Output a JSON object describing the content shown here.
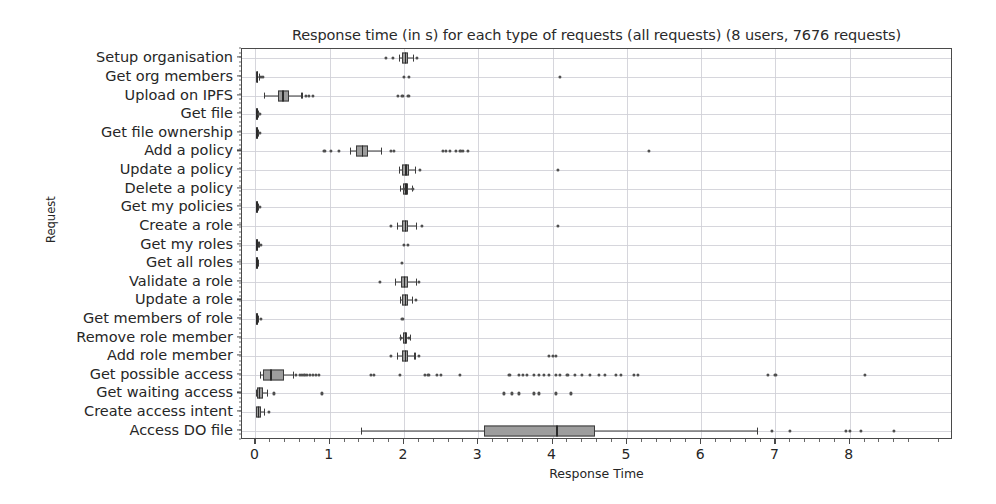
{
  "chart_data": {
    "type": "boxplot",
    "title": "Response time (in s) for each type of requests (all requests) (8 users, 7676 requests)",
    "xlabel": "Response Time",
    "ylabel": "Request",
    "xlim": [
      -0.18,
      9.39
    ],
    "ylim_categories": 21,
    "grid": true,
    "orientation": "horizontal",
    "legend": null,
    "xticks": [
      0,
      1,
      2,
      3,
      4,
      5,
      6,
      7,
      8
    ],
    "xtick_labels": [
      "0",
      "1",
      "2",
      "3",
      "4",
      "5",
      "6",
      "7",
      "8"
    ],
    "xminor_step": 0.2,
    "box_facecolor": "#9d9d9d",
    "box_edgecolor": "#3b3b3b",
    "categories": [
      "Setup organisation",
      "Get org members",
      "Upload on IPFS",
      "Get file",
      "Get file ownership",
      "Add a policy",
      "Update a policy",
      "Delete a policy",
      "Get my policies",
      "Create a role",
      "Get my roles",
      "Get all roles",
      "Validate a role",
      "Update a role",
      "Get members of role",
      "Remove role member",
      "Add role member",
      "Get possible access",
      "Get waiting access",
      "Create access intent",
      "Access DO file"
    ],
    "boxes": [
      {
        "category": "Setup organisation",
        "whisker_low": 1.93,
        "q1": 1.97,
        "median": 2.01,
        "q3": 2.06,
        "whisker_high": 2.12,
        "fliers": [
          1.76,
          1.85,
          2.18
        ]
      },
      {
        "category": "Get org members",
        "whisker_low": 0.005,
        "q1": 0.012,
        "median": 0.018,
        "q3": 0.026,
        "whisker_high": 0.045,
        "fliers": [
          0.07,
          0.1,
          2.0,
          2.07,
          4.1
        ]
      },
      {
        "category": "Upload on IPFS",
        "whisker_low": 0.12,
        "q1": 0.3,
        "median": 0.36,
        "q3": 0.45,
        "whisker_high": 0.62,
        "fliers": [
          0.68,
          0.72,
          0.78,
          1.92,
          1.98,
          2.06
        ]
      },
      {
        "category": "Get file",
        "whisker_low": 0.004,
        "q1": 0.008,
        "median": 0.012,
        "q3": 0.018,
        "whisker_high": 0.03,
        "fliers": [
          0.055
        ]
      },
      {
        "category": "Get file ownership",
        "whisker_low": 0.004,
        "q1": 0.008,
        "median": 0.013,
        "q3": 0.019,
        "whisker_high": 0.032,
        "fliers": [
          0.06
        ]
      },
      {
        "category": "Add a policy",
        "whisker_low": 1.27,
        "q1": 1.35,
        "median": 1.43,
        "q3": 1.52,
        "whisker_high": 1.69,
        "fliers": [
          0.93,
          1.02,
          1.12,
          1.82,
          1.86,
          2.52,
          2.57,
          2.62,
          2.7,
          2.76,
          2.8,
          2.86,
          5.3
        ]
      },
      {
        "category": "Update a policy",
        "whisker_low": 1.93,
        "q1": 1.98,
        "median": 2.02,
        "q3": 2.07,
        "whisker_high": 2.15,
        "fliers": [
          2.22,
          4.07
        ]
      },
      {
        "category": "Delete a policy",
        "whisker_low": 1.95,
        "q1": 1.99,
        "median": 2.02,
        "q3": 2.06,
        "whisker_high": 2.11,
        "fliers": [
          2.0,
          2.12
        ]
      },
      {
        "category": "Get my policies",
        "whisker_low": 0.004,
        "q1": 0.009,
        "median": 0.014,
        "q3": 0.02,
        "whisker_high": 0.034,
        "fliers": [
          0.06
        ]
      },
      {
        "category": "Create a role",
        "whisker_low": 1.9,
        "q1": 1.97,
        "median": 2.01,
        "q3": 2.06,
        "whisker_high": 2.16,
        "fliers": [
          1.82,
          2.24,
          4.07
        ]
      },
      {
        "category": "Get my roles",
        "whisker_low": 0.004,
        "q1": 0.01,
        "median": 0.015,
        "q3": 0.022,
        "whisker_high": 0.04,
        "fliers": [
          0.07,
          2.0,
          2.05
        ]
      },
      {
        "category": "Get all roles",
        "whisker_low": 0.004,
        "q1": 0.009,
        "median": 0.013,
        "q3": 0.019,
        "whisker_high": 0.031,
        "fliers": [
          1.97
        ]
      },
      {
        "category": "Validate a role",
        "whisker_low": 1.88,
        "q1": 1.96,
        "median": 2.0,
        "q3": 2.06,
        "whisker_high": 2.16,
        "fliers": [
          1.68,
          2.2
        ]
      },
      {
        "category": "Update a role",
        "whisker_low": 1.94,
        "q1": 1.98,
        "median": 2.01,
        "q3": 2.05,
        "whisker_high": 2.11,
        "fliers": [
          2.16
        ]
      },
      {
        "category": "Get members of role",
        "whisker_low": 0.004,
        "q1": 0.009,
        "median": 0.014,
        "q3": 0.02,
        "whisker_high": 0.035,
        "fliers": [
          0.07,
          1.98
        ]
      },
      {
        "category": "Remove role member",
        "whisker_low": 1.95,
        "q1": 1.99,
        "median": 2.01,
        "q3": 2.04,
        "whisker_high": 2.08,
        "fliers": [
          1.96,
          2.07
        ]
      },
      {
        "category": "Add role member",
        "whisker_low": 1.9,
        "q1": 1.97,
        "median": 2.01,
        "q3": 2.06,
        "whisker_high": 2.14,
        "fliers": [
          1.82,
          2.2,
          3.95,
          4.0,
          4.05
        ]
      },
      {
        "category": "Get possible access",
        "whisker_low": 0.06,
        "q1": 0.1,
        "median": 0.2,
        "q3": 0.38,
        "whisker_high": 0.5,
        "fliers": [
          0.55,
          0.6,
          0.63,
          0.66,
          0.7,
          0.74,
          0.78,
          0.82,
          0.86,
          1.55,
          1.6,
          1.95,
          2.28,
          2.33,
          2.45,
          2.5,
          2.75,
          3.42,
          3.55,
          3.6,
          3.65,
          3.75,
          3.82,
          3.88,
          3.95,
          4.05,
          4.1,
          4.2,
          4.3,
          4.4,
          4.5,
          4.62,
          4.7,
          4.85,
          4.92,
          5.1,
          5.15,
          6.9,
          7.0,
          8.2
        ]
      },
      {
        "category": "Get waiting access",
        "whisker_low": 0.005,
        "q1": 0.02,
        "median": 0.05,
        "q3": 0.1,
        "whisker_high": 0.16,
        "fliers": [
          0.25,
          0.9,
          3.35,
          3.45,
          3.55,
          3.75,
          3.82,
          4.05,
          4.25
        ]
      },
      {
        "category": "Create access intent",
        "whisker_low": 0.005,
        "q1": 0.015,
        "median": 0.035,
        "q3": 0.07,
        "whisker_high": 0.12,
        "fliers": [
          0.18
        ]
      },
      {
        "category": "Access DO file",
        "whisker_low": 1.42,
        "q1": 3.08,
        "median": 4.05,
        "q3": 4.57,
        "whisker_high": 6.75,
        "fliers": [
          6.95,
          7.2,
          7.95,
          8.0,
          8.15,
          8.6
        ]
      }
    ]
  }
}
